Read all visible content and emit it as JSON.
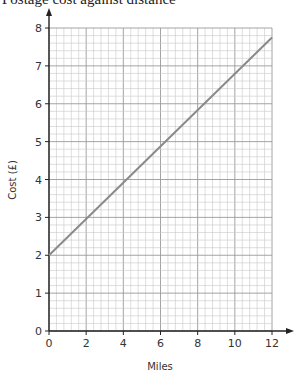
{
  "chart_data": {
    "type": "line",
    "title": "Postage cost against distance",
    "xlabel": "Miles",
    "ylabel": "Cost (£)",
    "xlim": [
      0,
      12
    ],
    "ylim": [
      0,
      8
    ],
    "x_ticks": [
      0,
      2,
      4,
      6,
      8,
      10,
      12
    ],
    "y_ticks": [
      0,
      1,
      2,
      3,
      4,
      5,
      6,
      7,
      8
    ],
    "x_tick_labels": [
      "0",
      "2",
      "4",
      "6",
      "8",
      "10",
      "12"
    ],
    "y_tick_labels": [
      "0",
      "1",
      "2",
      "3",
      "4",
      "5",
      "6",
      "7",
      "8"
    ],
    "grid": true,
    "grid_minor_x_step": 0.4,
    "grid_minor_y_step": 0.2,
    "series": [
      {
        "name": "Postage cost",
        "x": [
          0,
          12
        ],
        "y": [
          2,
          7.75
        ],
        "color": "#8a8a8a"
      }
    ],
    "legend": null
  },
  "colors": {
    "axis": "#222222",
    "grid_minor": "#c8c8c8",
    "grid_major": "#9a9a9a",
    "line": "#8a8a8a"
  }
}
